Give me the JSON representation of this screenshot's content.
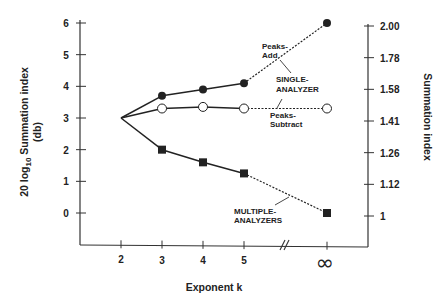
{
  "chart_data": {
    "type": "line",
    "title": "",
    "xlabel": "Exponent k",
    "ylabel_left": "20 log10 Summation index (db)",
    "ylabel_right": "Summation index",
    "x_categories": [
      "2",
      "3",
      "4",
      "5",
      "∞"
    ],
    "x_axis_break_between": [
      "5",
      "∞"
    ],
    "left_axis": {
      "range": [
        -1,
        6
      ],
      "ticks": [
        0,
        1,
        2,
        3,
        4,
        5,
        6
      ]
    },
    "right_axis": {
      "ticks": [
        "1",
        "1.12",
        "1.26",
        "1.41",
        "1.58",
        "1.78",
        "2.00"
      ]
    },
    "grid": false,
    "series": [
      {
        "name": "Single-analyzer, Peaks-Add",
        "marker": "filled-circle",
        "x": [
          "2",
          "3",
          "4",
          "5",
          "∞"
        ],
        "values": [
          3.0,
          3.7,
          3.9,
          4.1,
          6.0
        ],
        "dashed_segment": [
          "5",
          "∞"
        ]
      },
      {
        "name": "Single-analyzer, Peaks-Subtract",
        "marker": "open-circle",
        "x": [
          "2",
          "3",
          "4",
          "5",
          "∞"
        ],
        "values": [
          3.0,
          3.3,
          3.35,
          3.3,
          3.3
        ],
        "dashed_segment": [
          "5",
          "∞"
        ]
      },
      {
        "name": "Multiple-analyzers",
        "marker": "filled-square",
        "x": [
          "2",
          "3",
          "4",
          "5",
          "∞"
        ],
        "values": [
          3.0,
          2.0,
          1.6,
          1.25,
          0.0
        ],
        "dashed_segment": [
          "5",
          "∞"
        ]
      }
    ],
    "annotations": [
      {
        "text": [
          "Peaks-",
          "Add"
        ]
      },
      {
        "text": [
          "SINGLE-",
          "ANALYZER"
        ]
      },
      {
        "text": [
          "Peaks-",
          "Subtract"
        ]
      },
      {
        "text": [
          "MULTIPLE-",
          "ANALYZERS"
        ]
      }
    ]
  },
  "labels": {
    "xlabel": "Exponent k",
    "ylabel_left_pre": "20 log",
    "ylabel_left_sub": "10",
    "ylabel_left_post": " Summation index",
    "ylabel_left_unit": "(db)",
    "ylabel_right": "Summation index",
    "infinity": "∞",
    "peaks_add_1": "Peaks-",
    "peaks_add_2": "Add",
    "single_1": "SINGLE-",
    "single_2": "ANALYZER",
    "peaks_sub_1": "Peaks-",
    "peaks_sub_2": "Subtract",
    "multi_1": "MULTIPLE-",
    "multi_2": "ANALYZERS"
  },
  "colors": {
    "ink": "#222222",
    "background": "#ffffff"
  }
}
